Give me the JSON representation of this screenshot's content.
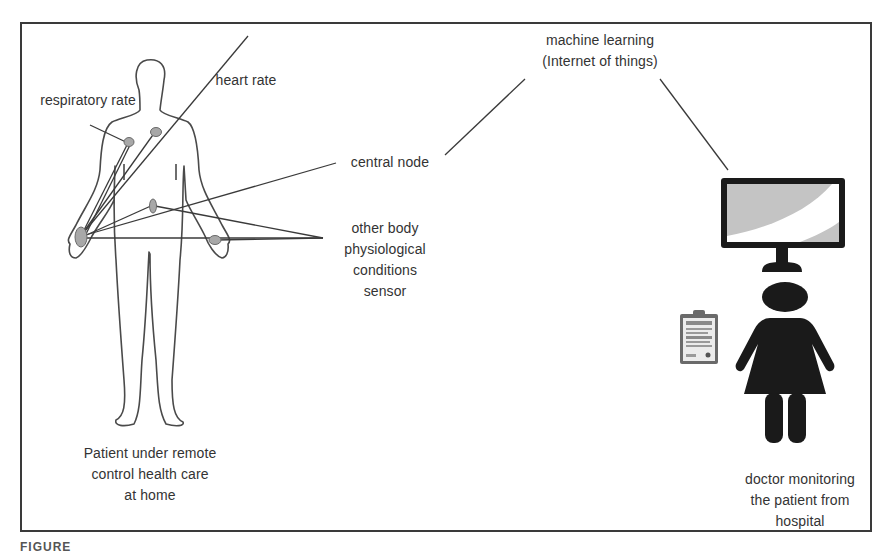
{
  "diagram": {
    "labels": {
      "respiratory_rate": "respiratory rate",
      "heart_rate": "heart rate",
      "central_node": "central node",
      "machine_learning_line1": "machine learning",
      "machine_learning_line2": "(Internet of things)",
      "other_sensor_line1": "other body",
      "other_sensor_line2": "physiological",
      "other_sensor_line3": "conditions",
      "other_sensor_line4": "sensor",
      "patient_line1": "Patient under remote",
      "patient_line2": "control health care",
      "patient_line3": "at home",
      "doctor_line1": "doctor monitoring",
      "doctor_line2": "the patient from",
      "doctor_line3": "hospital"
    },
    "nodes": [
      {
        "id": "respiratory-sensor",
        "label": "respiratory rate"
      },
      {
        "id": "heart-sensor",
        "label": "heart rate"
      },
      {
        "id": "abdomen-sensor",
        "label": "other body physiological conditions sensor"
      },
      {
        "id": "wrist-sensor",
        "label": "other body physiological conditions sensor"
      },
      {
        "id": "central-node",
        "label": "central node"
      },
      {
        "id": "monitor",
        "label": "machine learning (Internet of things)"
      },
      {
        "id": "doctor",
        "label": "doctor monitoring the patient from hospital"
      }
    ],
    "icons": {
      "patient": "human-body-outline-icon",
      "monitor": "computer-monitor-icon",
      "doctor": "female-person-icon",
      "clipboard": "clipboard-icon"
    },
    "colors": {
      "line": "#3a3a3a",
      "sensor_fill": "#a8a8a8",
      "icon_fill": "#1a1a1a",
      "screen_gray": "#c4c4c4"
    }
  },
  "caption": {
    "text": "FIGURE"
  }
}
